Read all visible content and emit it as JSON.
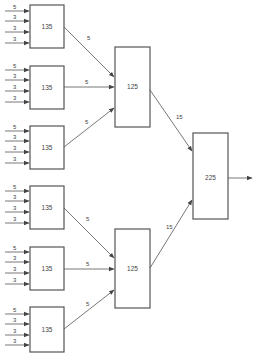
{
  "diagram": {
    "type": "flow-network",
    "stage1": [
      {
        "value": "135",
        "inputs": [
          "5",
          "3",
          "3",
          "3"
        ],
        "output": "5"
      },
      {
        "value": "135",
        "inputs": [
          "5",
          "3",
          "3",
          "3"
        ],
        "output": "5"
      },
      {
        "value": "135",
        "inputs": [
          "5",
          "3",
          "3",
          "3"
        ],
        "output": "5"
      },
      {
        "value": "135",
        "inputs": [
          "5",
          "3",
          "3",
          "3"
        ],
        "output": "5"
      },
      {
        "value": "135",
        "inputs": [
          "5",
          "3",
          "3",
          "3"
        ],
        "output": "5"
      },
      {
        "value": "135",
        "inputs": [
          "5",
          "3",
          "3",
          "3"
        ],
        "output": "5"
      }
    ],
    "stage2": [
      {
        "value": "125",
        "output": "15"
      },
      {
        "value": "125",
        "output": "15"
      }
    ],
    "stage3": {
      "value": "225"
    },
    "colors": {
      "stroke": "#555555",
      "text": "#444444",
      "background": "#ffffff"
    }
  }
}
